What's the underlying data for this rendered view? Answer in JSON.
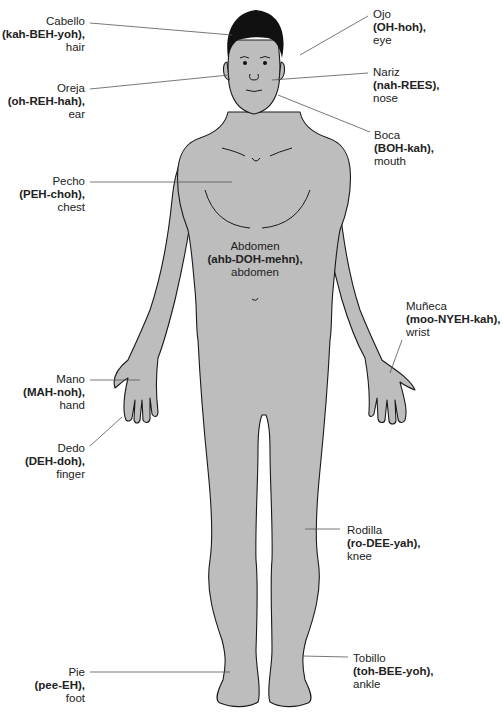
{
  "colors": {
    "skin": "#bdbdbd",
    "outline": "#1a1a1a",
    "hair": "#111111",
    "leader": "#555555",
    "text": "#222222"
  },
  "labels": {
    "cabello": {
      "es": "Cabello",
      "pron": "(kah-BEH-yoh),",
      "en": "hair"
    },
    "oreja": {
      "es": "Oreja",
      "pron": "(oh-REH-hah),",
      "en": "ear"
    },
    "ojo": {
      "es": "Ojo",
      "pron": "(OH-hoh),",
      "en": "eye"
    },
    "nariz": {
      "es": "Nariz",
      "pron": "(nah-REES),",
      "en": "nose"
    },
    "boca": {
      "es": "Boca",
      "pron": "(BOH-kah),",
      "en": "mouth"
    },
    "pecho": {
      "es": "Pecho",
      "pron": "(PEH-choh),",
      "en": "chest"
    },
    "abdomen": {
      "es": "Abdomen",
      "pron": "(ahb-DOH-mehn),",
      "en": "abdomen"
    },
    "muneca": {
      "es": "Muñeca",
      "pron": "(moo-NYEH-kah),",
      "en": "wrist"
    },
    "mano": {
      "es": "Mano",
      "pron": "(MAH-noh),",
      "en": "hand"
    },
    "dedo": {
      "es": "Dedo",
      "pron": "(DEH-doh),",
      "en": "finger"
    },
    "rodilla": {
      "es": "Rodilla",
      "pron": "(ro-DEE-yah),",
      "en": "knee"
    },
    "tobillo": {
      "es": "Tobillo",
      "pron": "(toh-BEE-yoh),",
      "en": "ankle"
    },
    "pie": {
      "es": "Pie",
      "pron": "(pee-EH),",
      "en": "foot"
    }
  }
}
